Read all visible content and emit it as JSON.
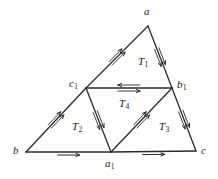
{
  "figure": {
    "name": "medial-triangle-diagram",
    "stroke_color": "#2b2b2b",
    "background_color": "#ffffff",
    "label_color": "#1a1a1a"
  },
  "vertices": [
    {
      "id": "a",
      "label": "a",
      "sub": "",
      "x": 148,
      "y": 26,
      "label_x": 144,
      "label_y": 6
    },
    {
      "id": "b",
      "label": "b",
      "sub": "",
      "x": 26,
      "y": 152,
      "label_x": 13,
      "label_y": 145
    },
    {
      "id": "c",
      "label": "c",
      "sub": "",
      "x": 196,
      "y": 151,
      "label_x": 201,
      "label_y": 145
    },
    {
      "id": "c1",
      "label": "c",
      "sub": "1",
      "x": 86,
      "y": 88,
      "label_x": 69,
      "label_y": 78
    },
    {
      "id": "b1",
      "label": "b",
      "sub": "1",
      "x": 172,
      "y": 88,
      "label_x": 177,
      "label_y": 79
    },
    {
      "id": "a1",
      "label": "a",
      "sub": "1",
      "x": 111,
      "y": 152,
      "label_x": 105,
      "label_y": 158
    }
  ],
  "edges": [
    {
      "id": "b-c1",
      "from": "b",
      "to": "c1",
      "marks": 2,
      "direction": "forward"
    },
    {
      "id": "c1-a",
      "from": "c1",
      "to": "a",
      "marks": 2,
      "direction": "forward"
    },
    {
      "id": "a-b1",
      "from": "a",
      "to": "b1",
      "marks": 2,
      "direction": "forward"
    },
    {
      "id": "b1-c",
      "from": "b1",
      "to": "c",
      "marks": 2,
      "direction": "forward"
    },
    {
      "id": "b-a1",
      "from": "b",
      "to": "a1",
      "marks": 1,
      "direction": "forward"
    },
    {
      "id": "a1-c",
      "from": "a1",
      "to": "c",
      "marks": 1,
      "direction": "forward"
    },
    {
      "id": "c1-b1",
      "from": "c1",
      "to": "b1",
      "marks": 1,
      "direction": "both"
    },
    {
      "id": "c1-a1",
      "from": "c1",
      "to": "a1",
      "marks": 2,
      "direction": "forward"
    },
    {
      "id": "a1-b1",
      "from": "a1",
      "to": "b1",
      "marks": 2,
      "direction": "forward"
    }
  ],
  "regions": [
    {
      "id": "T1",
      "label": "T",
      "sub": "1",
      "label_x": 138,
      "label_y": 56
    },
    {
      "id": "T4",
      "label": "T",
      "sub": "4",
      "label_x": 119,
      "label_y": 98
    },
    {
      "id": "T2",
      "label": "T",
      "sub": "2",
      "label_x": 72,
      "label_y": 121
    },
    {
      "id": "T3",
      "label": "T",
      "sub": "3",
      "label_x": 159,
      "label_y": 121
    }
  ]
}
